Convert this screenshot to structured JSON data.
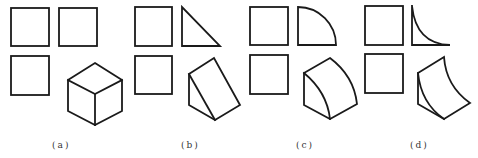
{
  "figure": {
    "type": "three-view projections with isometric solids",
    "stroke_color": "#1a1a1a",
    "background": "#ffffff",
    "panels": [
      {
        "id": "a",
        "label": "(a)",
        "front_view": "square",
        "side_view": "square",
        "top_view": "square",
        "solid": "cube"
      },
      {
        "id": "b",
        "label": "(b)",
        "front_view": "square",
        "side_view": "right-triangle",
        "top_view": "square",
        "solid": "triangular-prism-wedge"
      },
      {
        "id": "c",
        "label": "(c)",
        "front_view": "square",
        "side_view": "quarter-circle-convex",
        "top_view": "square",
        "solid": "quarter-cylinder"
      },
      {
        "id": "d",
        "label": "(d)",
        "front_view": "square",
        "side_view": "concave-fillet",
        "top_view": "square",
        "solid": "concave-ramp"
      }
    ]
  }
}
